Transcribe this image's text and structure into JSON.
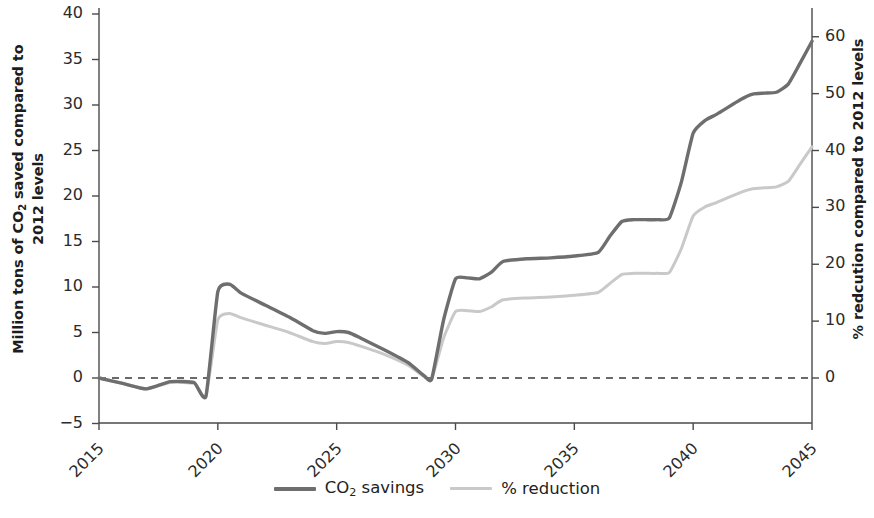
{
  "axes": {
    "left_title_parts": [
      "Million tons of CO",
      "2",
      " saved compared to 2012 levels"
    ],
    "left_title": "Million tons of CO2 saved compared to 2012 levels",
    "right_title": "% redcution compared to 2012 levels",
    "left_ticks": [
      "40",
      "35",
      "30",
      "25",
      "20",
      "15",
      "10",
      "5",
      "0",
      "-5"
    ],
    "right_ticks": [
      "60",
      "50",
      "40",
      "30",
      "20",
      "10",
      "0"
    ],
    "x_ticks": [
      "2015",
      "2020",
      "2025",
      "2030",
      "2035",
      "2040",
      "2045"
    ]
  },
  "legend": {
    "items": [
      {
        "label_parts": [
          "CO",
          "2",
          " savings"
        ],
        "label": "CO2 savings",
        "color": "#6e6e6e"
      },
      {
        "label": "% reduction",
        "color": "#c9c9c9"
      }
    ]
  },
  "chart_data": {
    "type": "line",
    "title": "",
    "xlabel": "",
    "ylabel": "Million tons of CO2 saved compared to 2012 levels",
    "y2label": "% redcution compared to 2012 levels",
    "xlim": [
      2015,
      2045
    ],
    "ylim": [
      -5,
      40
    ],
    "y2lim": [
      -8,
      64
    ],
    "grid": false,
    "legend_position": "bottom-center",
    "zero_reference_line": true,
    "x": [
      2015,
      2016,
      2017,
      2018,
      2019,
      2019.5,
      2020,
      2020.5,
      2021,
      2022,
      2023,
      2024,
      2024.5,
      2025,
      2025.5,
      2026,
      2027,
      2028,
      2028.7,
      2029,
      2029.5,
      2030,
      2030.5,
      2031,
      2031.5,
      2032,
      2033,
      2034,
      2035,
      2036,
      2036.5,
      2037,
      2037.5,
      2038,
      2038.5,
      2039,
      2039.5,
      2040,
      2040.5,
      2041,
      2042,
      2042.5,
      2043,
      2043.5,
      2044,
      2044.5,
      2045
    ],
    "series": [
      {
        "name": "CO2 savings",
        "axis": "left",
        "color": "#6e6e6e",
        "values": [
          0.0,
          -0.6,
          -1.2,
          -0.4,
          -0.5,
          -2.0,
          9.5,
          10.3,
          9.3,
          8.0,
          6.7,
          5.2,
          4.9,
          5.1,
          5.0,
          4.4,
          3.1,
          1.7,
          0.2,
          -0.1,
          6.4,
          10.9,
          11.0,
          10.9,
          11.6,
          12.8,
          13.1,
          13.2,
          13.4,
          13.8,
          15.6,
          17.2,
          17.4,
          17.4,
          17.4,
          17.6,
          21.5,
          26.9,
          28.3,
          29.0,
          30.6,
          31.2,
          31.3,
          31.4,
          32.3,
          34.6,
          37.0
        ]
      },
      {
        "name": "% reduction",
        "axis": "right",
        "color": "#c9c9c9",
        "values_left_scale": [
          0.0,
          -0.6,
          -1.2,
          -0.5,
          -0.6,
          -2.0,
          6.4,
          7.1,
          6.6,
          5.8,
          5.0,
          4.0,
          3.8,
          4.0,
          3.9,
          3.5,
          2.6,
          1.4,
          0.1,
          -0.1,
          4.4,
          7.3,
          7.4,
          7.3,
          7.8,
          8.6,
          8.8,
          8.9,
          9.1,
          9.4,
          10.4,
          11.4,
          11.5,
          11.5,
          11.5,
          11.6,
          14.2,
          17.8,
          18.8,
          19.3,
          20.4,
          20.8,
          20.9,
          21.0,
          21.6,
          23.5,
          25.4
        ],
        "values": [
          0.0,
          -1.0,
          -1.9,
          -0.8,
          -1.0,
          -3.2,
          10.2,
          11.3,
          10.5,
          9.3,
          8.0,
          6.4,
          6.1,
          6.4,
          6.2,
          5.6,
          4.2,
          2.2,
          0.2,
          -0.2,
          7.0,
          11.7,
          11.8,
          11.7,
          12.5,
          13.8,
          14.1,
          14.2,
          14.6,
          15.0,
          16.6,
          18.2,
          18.4,
          18.4,
          18.4,
          18.6,
          22.7,
          28.5,
          30.1,
          30.9,
          32.6,
          33.3,
          33.4,
          33.6,
          34.6,
          37.6,
          40.6
        ]
      }
    ]
  }
}
